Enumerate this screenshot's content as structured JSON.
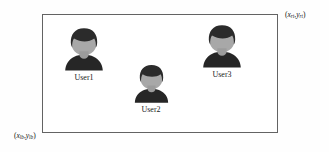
{
  "figure": {
    "type": "diagram",
    "background_color": "#fefefe"
  },
  "region": {
    "name": "bounding-region",
    "border_color": "#636363",
    "fill_color": "#ffffff",
    "corner_labels": {
      "top_right": {
        "open": "(",
        "x_var": "x",
        "x_sub": "rt",
        "comma": ",",
        "y_var": "y",
        "y_sub": "rt",
        "close": ")"
      },
      "bottom_left": {
        "open": "(",
        "x_var": "x",
        "x_sub": "lb",
        "comma": ",",
        "y_var": "y",
        "y_sub": "lb",
        "close": ")"
      }
    }
  },
  "users": [
    {
      "label": "User1",
      "icon": "person-avatar-icon",
      "hair_color": "#2b2b2b",
      "face_color": "#a8a8a8",
      "body_color": "#262626"
    },
    {
      "label": "User2",
      "icon": "person-avatar-icon",
      "hair_color": "#2b2b2b",
      "face_color": "#a8a8a8",
      "body_color": "#262626"
    },
    {
      "label": "User3",
      "icon": "person-avatar-icon",
      "hair_color": "#2b2b2b",
      "face_color": "#a8a8a8",
      "body_color": "#262626"
    }
  ]
}
